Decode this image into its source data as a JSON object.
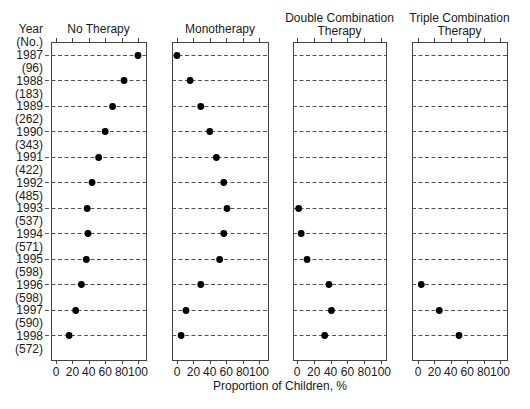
{
  "chart_data": {
    "type": "scatter",
    "subtype": "dot-plot-small-multiples",
    "title": "",
    "xlabel": "Proportion of Children, %",
    "ylabel_line1": "Year",
    "ylabel_line2": "(No.)",
    "xlim": [
      0,
      100
    ],
    "xticks": [
      0,
      20,
      40,
      60,
      80,
      100
    ],
    "grid": "dashed horizontal guide per row",
    "categories": [
      "1987",
      "1988",
      "1989",
      "1990",
      "1991",
      "1992",
      "1993",
      "1994",
      "1995",
      "1996",
      "1997",
      "1998"
    ],
    "counts": [
      "(96)",
      "(183)",
      "(262)",
      "(343)",
      "(422)",
      "(485)",
      "(537)",
      "(571)",
      "(598)",
      "(598)",
      "(590)",
      "(572)"
    ],
    "panels": [
      {
        "name": "No Therapy",
        "title_lines": [
          "No Therapy"
        ],
        "values": [
          100,
          83,
          69,
          60,
          52,
          44,
          38,
          39,
          37,
          31,
          24,
          16
        ]
      },
      {
        "name": "Monotherapy",
        "title_lines": [
          "Monotherapy"
        ],
        "values": [
          0,
          16,
          29,
          40,
          48,
          57,
          61,
          57,
          52,
          29,
          11,
          5
        ]
      },
      {
        "name": "Double Combination Therapy",
        "title_lines": [
          "Double Combination",
          "Therapy"
        ],
        "values": [
          null,
          null,
          null,
          null,
          null,
          null,
          2,
          5,
          12,
          38,
          41,
          33
        ]
      },
      {
        "name": "Triple Combination Therapy",
        "title_lines": [
          "Triple Combination",
          "Therapy"
        ],
        "values": [
          null,
          null,
          null,
          null,
          null,
          null,
          null,
          null,
          null,
          4,
          26,
          50
        ]
      }
    ]
  },
  "layout": {
    "panels_px": [
      {
        "frame_left": 51,
        "frame_right": 146,
        "x0": 56,
        "x100": 138
      },
      {
        "frame_left": 172,
        "frame_right": 268,
        "x0": 177,
        "x100": 259
      },
      {
        "frame_left": 293,
        "frame_right": 386,
        "x0": 297,
        "x100": 381
      },
      {
        "frame_left": 412,
        "frame_right": 507,
        "x0": 418,
        "x100": 500
      }
    ],
    "frame_top": 42,
    "frame_bottom": 360,
    "first_row_y": 54.7,
    "row_step": 25.5,
    "dot_color": "#000000"
  }
}
